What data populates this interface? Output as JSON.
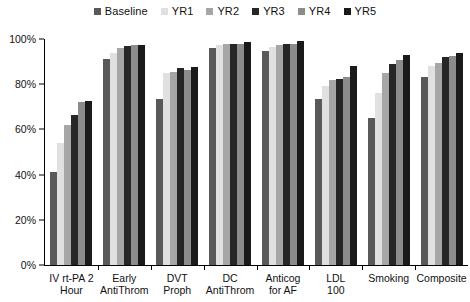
{
  "legend": {
    "position": "top-center",
    "items": [
      {
        "label": "Baseline",
        "color": "#595959"
      },
      {
        "label": "YR1",
        "color": "#e0e0e0"
      },
      {
        "label": "YR2",
        "color": "#a6a6a6"
      },
      {
        "label": "YR3",
        "color": "#262626"
      },
      {
        "label": "YR4",
        "color": "#8c8c8c"
      },
      {
        "label": "YR5",
        "color": "#1a1a1a"
      }
    ]
  },
  "axes": {
    "y_ticks": [
      "0%",
      "20%",
      "40%",
      "60%",
      "80%",
      "100%"
    ],
    "y_tick_values": [
      0,
      20,
      40,
      60,
      80,
      100
    ],
    "y_min": 0,
    "y_max": 100
  },
  "chart_data": {
    "type": "bar",
    "title": "",
    "subtitle": "",
    "xlabel": "",
    "ylabel": "",
    "ylim": [
      0,
      100
    ],
    "grid": false,
    "legend_position": "top-center",
    "categories": [
      "IV rt-PA 2 Hour",
      "Early AntiThrom",
      "DVT Proph",
      "DC AntiThrom",
      "Anticog for AF",
      "LDL 100",
      "Smoking",
      "Composite"
    ],
    "category_lines": [
      [
        "IV rt-PA 2",
        "Hour"
      ],
      [
        "Early",
        "AntiThrom"
      ],
      [
        "DVT",
        "Proph"
      ],
      [
        "DC",
        "AntiThrom"
      ],
      [
        "Anticog",
        "for AF"
      ],
      [
        "LDL",
        "100"
      ],
      [
        "Smoking",
        ""
      ],
      [
        "Composite",
        ""
      ]
    ],
    "series": [
      {
        "name": "Baseline",
        "color": "#595959",
        "values": [
          41,
          91,
          73.5,
          96,
          94.5,
          73.5,
          65,
          83
        ]
      },
      {
        "name": "YR1",
        "color": "#e0e0e0",
        "values": [
          54,
          94,
          85,
          97.5,
          96.5,
          79,
          76,
          88
        ]
      },
      {
        "name": "YR2",
        "color": "#a6a6a6",
        "values": [
          62,
          96,
          85.5,
          98,
          97.5,
          82,
          85,
          89.5
        ]
      },
      {
        "name": "YR3",
        "color": "#262626",
        "values": [
          66.5,
          97,
          87,
          98,
          98,
          82.5,
          89,
          92
        ]
      },
      {
        "name": "YR4",
        "color": "#8c8c8c",
        "values": [
          72,
          97.5,
          86.5,
          98,
          98,
          83,
          90.5,
          92.5
        ]
      },
      {
        "name": "YR5",
        "color": "#1a1a1a",
        "values": [
          72.5,
          97.5,
          87.5,
          98.5,
          99,
          88,
          93,
          94
        ]
      }
    ]
  }
}
